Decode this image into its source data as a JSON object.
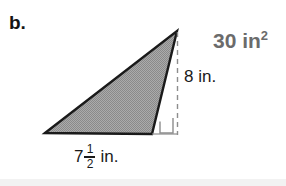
{
  "problem": {
    "part_label": "b.",
    "area_value": "30 in",
    "area_exponent": "2",
    "height_label": "8 in.",
    "base_whole": "7",
    "base_numerator": "1",
    "base_denominator": "2",
    "base_unit": "in."
  },
  "figure": {
    "shape": "triangle",
    "fill_color": "#9a9a9a",
    "outline_color": "#1a1a1a",
    "dashed_color": "#808080",
    "right_angle_color": "#808080",
    "background_color": "#ffffff",
    "vertices": {
      "left": [
        45,
        133
      ],
      "apex": [
        177,
        31
      ],
      "bottom_right": [
        152,
        134
      ]
    },
    "height_line": {
      "x": 177,
      "y_top": 32,
      "y_bottom": 134
    },
    "base_extension": {
      "x_start": 152,
      "x_end": 177,
      "y": 134
    },
    "right_angle_marker": {
      "x": 160,
      "y": 117,
      "size": 13
    }
  },
  "colors": {
    "area_text": "#6b6b6b",
    "label_text": "#141414",
    "dimension_text": "#1a1a1a"
  }
}
